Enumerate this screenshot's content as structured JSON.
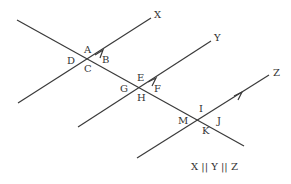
{
  "diagram": {
    "type": "parallel-lines-transversal",
    "caption": "X || Y || Z",
    "colors": {
      "line": "#3a3a3a",
      "text": "#333333",
      "background": "#ffffff"
    },
    "lines": [
      {
        "name": "X",
        "label": "X",
        "x1": 18,
        "y1": 103,
        "x2": 151,
        "y2": 18
      },
      {
        "name": "Y",
        "label": "Y",
        "x1": 78,
        "y1": 127,
        "x2": 211,
        "y2": 41
      },
      {
        "name": "Z",
        "label": "Z",
        "x1": 137,
        "y1": 158,
        "x2": 269,
        "y2": 75
      }
    ],
    "transversal": {
      "x1": 17,
      "y1": 20,
      "x2": 244,
      "y2": 146
    },
    "intersections": [
      {
        "line": "X",
        "x": 88,
        "y": 59,
        "angles": {
          "top": "A",
          "right": "B",
          "bottom": "C",
          "left": "D"
        }
      },
      {
        "line": "Y",
        "x": 141,
        "y": 87,
        "angles": {
          "top": "E",
          "right": "F",
          "bottom": "H",
          "left": "G"
        }
      },
      {
        "line": "Z",
        "x": 202,
        "y": 118,
        "angles": {
          "top": "I",
          "right": "J",
          "bottom": "K",
          "left": "M"
        }
      }
    ],
    "angle_labels": [
      "A",
      "B",
      "C",
      "D",
      "E",
      "F",
      "G",
      "H",
      "I",
      "J",
      "K",
      "M"
    ]
  }
}
